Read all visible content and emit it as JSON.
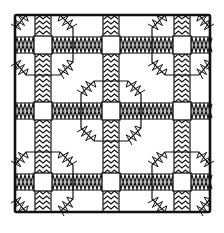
{
  "artwork": {
    "title": "Quilt block line drawing",
    "style": "black ink on white",
    "colors": {
      "ink": "#111111",
      "paper": "#ffffff"
    },
    "motifs": [
      "outer-border",
      "sashing-strips-zigzag",
      "cornerstone-squares",
      "octagon-rings",
      "plain-background-patches"
    ],
    "grid": {
      "divisions": 3,
      "cornerstones": 9,
      "octagons": 5
    }
  }
}
